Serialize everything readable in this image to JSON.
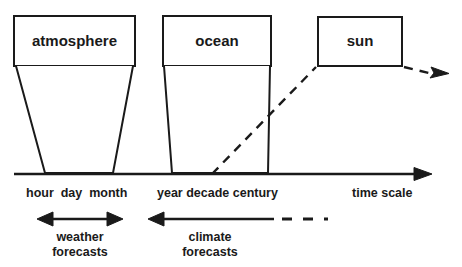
{
  "figure": {
    "type": "diagram",
    "title_visible": false,
    "background_color": "#ffffff",
    "stroke_color": "#1a1a1a",
    "text_color": "#1a1a1a"
  },
  "boxes": [
    {
      "name": "atmosphere",
      "label": "atmosphere"
    },
    {
      "name": "ocean",
      "label": "ocean"
    },
    {
      "name": "sun",
      "label": "sun"
    }
  ],
  "axis": {
    "title": "time scale",
    "tick_groups": [
      {
        "name": "short-scales",
        "label": "hour  day  month"
      },
      {
        "name": "long-scales",
        "label": "year decade century"
      }
    ]
  },
  "ranges": [
    {
      "name": "weather-forecasts",
      "line1": "weather",
      "line2": "forecasts",
      "arrow_style": "double-headed-solid"
    },
    {
      "name": "climate-forecasts",
      "line1": "climate",
      "line2": "forecasts",
      "arrow_style": "left-headed-solid-then-dashed"
    }
  ],
  "connectors": [
    {
      "name": "sun-forcing-line",
      "style": "dashed",
      "description": "dashed line rising from time axis to sun box and exiting right with arrowhead"
    }
  ]
}
